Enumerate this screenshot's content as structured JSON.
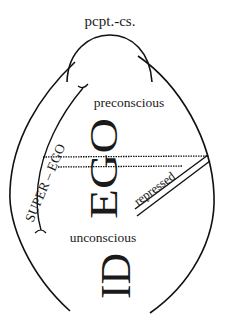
{
  "diagram": {
    "labels": {
      "perception_consciousness": "pcpt.-cs.",
      "preconscious": "preconscious",
      "unconscious": "unconscious",
      "super_ego": "SUPER – EGO",
      "ego": "EGO",
      "id": "ID",
      "repressed": "repressed"
    },
    "colors": {
      "stroke": "#111111",
      "text": "#1a1a1a",
      "background": "#ffffff"
    }
  }
}
